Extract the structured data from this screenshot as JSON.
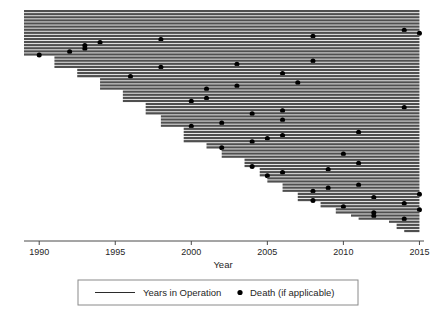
{
  "chart_data": {
    "type": "bar",
    "title": "",
    "subtitle": "",
    "xlabel": "Year",
    "ylabel": "",
    "orientation": "horizontal",
    "xlim": [
      1989,
      2015.3
    ],
    "ylim": [
      0,
      70
    ],
    "grid": false,
    "x_ticks": [
      1990,
      1995,
      2000,
      2005,
      2010,
      2015
    ],
    "x_tick_labels": [
      "1990",
      "1995",
      "2000",
      "2005",
      "2010",
      "2015"
    ],
    "legend": {
      "position": "bottom",
      "entries": [
        {
          "label": "Years in Operation",
          "marker": "line",
          "color": "#2b2b2b"
        },
        {
          "label": "Death (if applicable)",
          "marker": "dot",
          "color": "#000000"
        }
      ]
    },
    "series_name": "Years in Operation",
    "death_series_name": "Death (if applicable)",
    "bar_color": "#4f4f4f",
    "death_marker_color": "#000000",
    "end_year": 2015,
    "bars": [
      {
        "start": 1989.0,
        "end": 2015.0,
        "death": null
      },
      {
        "start": 1989.0,
        "end": 2015.0,
        "death": null
      },
      {
        "start": 1989.0,
        "end": 2015.0,
        "death": null
      },
      {
        "start": 1989.0,
        "end": 2015.0,
        "death": null
      },
      {
        "start": 1989.0,
        "end": 2015.0,
        "death": null
      },
      {
        "start": 1989.0,
        "end": 2015.0,
        "death": null
      },
      {
        "start": 1989.0,
        "end": 2015.0,
        "death": 2014.0
      },
      {
        "start": 1989.0,
        "end": 2015.0,
        "death": 2015.0
      },
      {
        "start": 1989.0,
        "end": 2015.0,
        "death": 2008.0
      },
      {
        "start": 1989.0,
        "end": 2015.0,
        "death": 1998.0
      },
      {
        "start": 1989.0,
        "end": 2015.0,
        "death": 1994.0
      },
      {
        "start": 1989.0,
        "end": 2015.0,
        "death": 1993.0
      },
      {
        "start": 1989.0,
        "end": 2015.0,
        "death": 1993.0
      },
      {
        "start": 1989.0,
        "end": 2015.0,
        "death": 1992.0
      },
      {
        "start": 1989.0,
        "end": 2015.0,
        "death": 1990.0
      },
      {
        "start": 1991.0,
        "end": 2015.0,
        "death": null
      },
      {
        "start": 1991.0,
        "end": 2015.0,
        "death": 2008.0
      },
      {
        "start": 1991.0,
        "end": 2015.0,
        "death": 2003.0
      },
      {
        "start": 1991.0,
        "end": 2015.0,
        "death": 1998.0
      },
      {
        "start": 1992.5,
        "end": 2015.0,
        "death": null
      },
      {
        "start": 1992.5,
        "end": 2015.0,
        "death": 2006.0
      },
      {
        "start": 1992.5,
        "end": 2015.0,
        "death": 1996.0
      },
      {
        "start": 1994.0,
        "end": 2015.0,
        "death": null
      },
      {
        "start": 1994.0,
        "end": 2015.0,
        "death": 2007.0
      },
      {
        "start": 1994.0,
        "end": 2015.0,
        "death": 2003.0
      },
      {
        "start": 1994.0,
        "end": 2015.0,
        "death": 2001.0
      },
      {
        "start": 1995.5,
        "end": 2015.0,
        "death": null
      },
      {
        "start": 1995.5,
        "end": 2015.0,
        "death": null
      },
      {
        "start": 1995.5,
        "end": 2015.0,
        "death": 2001.0
      },
      {
        "start": 1995.5,
        "end": 2015.0,
        "death": 2000.0
      },
      {
        "start": 1997.0,
        "end": 2015.0,
        "death": null
      },
      {
        "start": 1997.0,
        "end": 2015.0,
        "death": 2014.0
      },
      {
        "start": 1997.0,
        "end": 2015.0,
        "death": 2006.0
      },
      {
        "start": 1997.0,
        "end": 2015.0,
        "death": 2004.0
      },
      {
        "start": 1998.0,
        "end": 2015.0,
        "death": null
      },
      {
        "start": 1998.0,
        "end": 2015.0,
        "death": 2006.0
      },
      {
        "start": 1998.0,
        "end": 2015.0,
        "death": 2002.0
      },
      {
        "start": 1998.0,
        "end": 2015.0,
        "death": 2000.0
      },
      {
        "start": 1999.5,
        "end": 2015.0,
        "death": null
      },
      {
        "start": 1999.5,
        "end": 2015.0,
        "death": 2011.0
      },
      {
        "start": 1999.5,
        "end": 2015.0,
        "death": 2006.0
      },
      {
        "start": 1999.5,
        "end": 2015.0,
        "death": 2005.0
      },
      {
        "start": 1999.5,
        "end": 2015.0,
        "death": 2004.0
      },
      {
        "start": 2001.0,
        "end": 2015.0,
        "death": null
      },
      {
        "start": 2001.0,
        "end": 2015.0,
        "death": 2002.0
      },
      {
        "start": 2002.0,
        "end": 2015.0,
        "death": null
      },
      {
        "start": 2002.0,
        "end": 2015.0,
        "death": 2010.0
      },
      {
        "start": 2002.0,
        "end": 2015.0,
        "death": null
      },
      {
        "start": 2003.5,
        "end": 2015.0,
        "death": null
      },
      {
        "start": 2003.5,
        "end": 2015.0,
        "death": 2011.0
      },
      {
        "start": 2003.5,
        "end": 2015.0,
        "death": 2004.0
      },
      {
        "start": 2004.5,
        "end": 2015.0,
        "death": 2009.0
      },
      {
        "start": 2004.5,
        "end": 2015.0,
        "death": 2006.0
      },
      {
        "start": 2004.5,
        "end": 2015.0,
        "death": 2005.0
      },
      {
        "start": 2005.0,
        "end": 2015.0,
        "death": null
      },
      {
        "start": 2005.0,
        "end": 2015.0,
        "death": null
      },
      {
        "start": 2006.0,
        "end": 2015.0,
        "death": 2011.0
      },
      {
        "start": 2006.0,
        "end": 2015.0,
        "death": 2009.0
      },
      {
        "start": 2006.0,
        "end": 2015.0,
        "death": 2008.0
      },
      {
        "start": 2007.0,
        "end": 2015.0,
        "death": 2015.0
      },
      {
        "start": 2007.0,
        "end": 2015.0,
        "death": 2012.0
      },
      {
        "start": 2007.0,
        "end": 2015.0,
        "death": 2008.0
      },
      {
        "start": 2008.5,
        "end": 2015.0,
        "death": 2014.0
      },
      {
        "start": 2008.5,
        "end": 2015.0,
        "death": 2010.0
      },
      {
        "start": 2009.5,
        "end": 2015.0,
        "death": 2015.0
      },
      {
        "start": 2009.5,
        "end": 2015.0,
        "death": 2012.0
      },
      {
        "start": 2010.5,
        "end": 2015.0,
        "death": 2012.0
      },
      {
        "start": 2011.0,
        "end": 2015.0,
        "death": 2014.0
      },
      {
        "start": 2013.0,
        "end": 2015.0,
        "death": null
      },
      {
        "start": 2013.5,
        "end": 2015.0,
        "death": null
      },
      {
        "start": 2013.5,
        "end": 2015.0,
        "death": null
      },
      {
        "start": 2014.0,
        "end": 2015.0,
        "death": null
      }
    ]
  }
}
